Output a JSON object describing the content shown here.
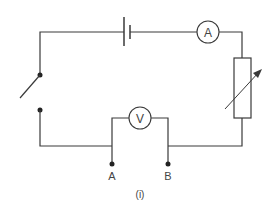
{
  "diagram": {
    "type": "circuit",
    "caption": "(i)",
    "components": {
      "battery": {
        "label": ""
      },
      "ammeter": {
        "symbol": "A"
      },
      "voltmeter": {
        "symbol": "V"
      },
      "variable_resistor": {
        "label": ""
      },
      "switch": {
        "state": "open"
      }
    },
    "terminals": [
      {
        "label": "A"
      },
      {
        "label": "B"
      }
    ],
    "colors": {
      "line": "#3a3a3a",
      "background": "#ffffff"
    }
  }
}
